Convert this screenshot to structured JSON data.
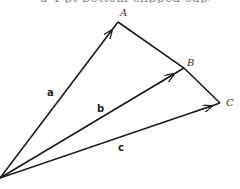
{
  "caption": {
    "text": "a 4 pt bottom clipped caption."
  },
  "diagram": {
    "origin": {
      "x": 0,
      "y": 178
    },
    "points": [
      {
        "name": "A",
        "x": 118,
        "y": 22,
        "label_x": 120,
        "label_y": 16
      },
      {
        "name": "B",
        "x": 184,
        "y": 68,
        "label_x": 187,
        "label_y": 66
      },
      {
        "name": "C",
        "x": 220,
        "y": 103,
        "label_x": 226,
        "label_y": 106
      }
    ],
    "vectors": [
      {
        "name": "a",
        "label": "a",
        "label_x": 47,
        "label_y": 96
      },
      {
        "name": "b",
        "label": "b",
        "label_x": 97,
        "label_y": 112
      },
      {
        "name": "c",
        "label": "c",
        "label_x": 118,
        "label_y": 151
      }
    ],
    "colors": {
      "stroke": "#1a1a1a",
      "background": "#ffffff"
    }
  }
}
